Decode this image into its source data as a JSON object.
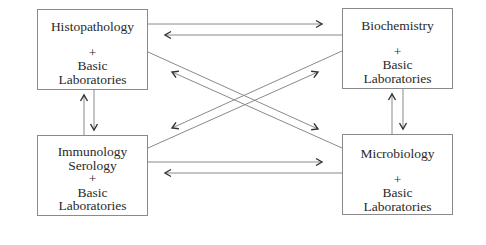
{
  "diagram": {
    "colors": {
      "line": "#8a8a8a",
      "arrowhead": "#333333",
      "text": "#2a2a2a",
      "background": "#ffffff"
    },
    "nodes": [
      {
        "id": "histopathology",
        "lines": [
          "Histopathology",
          "",
          "+",
          "Basic",
          "Laboratories"
        ]
      },
      {
        "id": "biochemistry",
        "lines": [
          "Biochemistry",
          "",
          "+",
          "Basic",
          "Laboratories"
        ]
      },
      {
        "id": "immunology",
        "lines": [
          "Immunology",
          "Serology",
          "+",
          "Basic",
          "Laboratories"
        ]
      },
      {
        "id": "microbiology",
        "lines": [
          "Microbiology",
          "",
          "+",
          "Basic",
          "Laboratories"
        ]
      }
    ],
    "edges": [
      {
        "from": "histopathology",
        "to": "biochemistry"
      },
      {
        "from": "biochemistry",
        "to": "histopathology"
      },
      {
        "from": "immunology",
        "to": "microbiology"
      },
      {
        "from": "microbiology",
        "to": "immunology"
      },
      {
        "from": "immunology",
        "to": "histopathology"
      },
      {
        "from": "histopathology",
        "to": "immunology"
      },
      {
        "from": "microbiology",
        "to": "biochemistry"
      },
      {
        "from": "biochemistry",
        "to": "microbiology"
      },
      {
        "from": "histopathology",
        "to": "microbiology"
      },
      {
        "from": "microbiology",
        "to": "histopathology"
      },
      {
        "from": "immunology",
        "to": "biochemistry"
      },
      {
        "from": "biochemistry",
        "to": "immunology"
      }
    ]
  }
}
